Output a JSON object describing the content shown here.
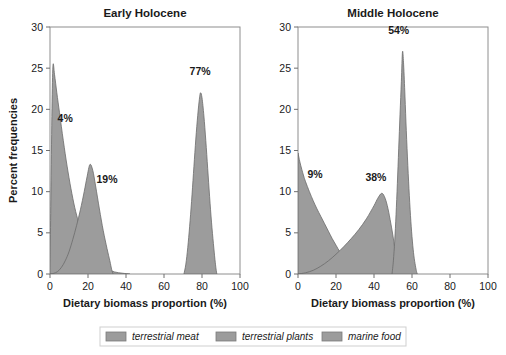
{
  "figure": {
    "background": "#ffffff",
    "series_color": "#9c9c9c",
    "series_edge_color": "#6b6b6b",
    "text_color": "#1a1a1a"
  },
  "axis": {
    "ylabel": "Percent frequencies",
    "xlabel_left": "Dietary biomass proportion (%)",
    "xlabel_right": "Dietary biomass proportion (%)",
    "yticks": [
      "0",
      "5",
      "10",
      "15",
      "20",
      "25",
      "30"
    ],
    "xticks": [
      "0",
      "20",
      "40",
      "60",
      "80",
      "100"
    ],
    "xlim": [
      0,
      100
    ],
    "ylim": [
      0,
      30
    ]
  },
  "legend": {
    "position": "bottom-center",
    "items": [
      {
        "label": "terrestrial meat",
        "color": "#9c9c9c"
      },
      {
        "label": "terrestrial plants",
        "color": "#9c9c9c"
      },
      {
        "label": "marine food",
        "color": "#9c9c9c"
      }
    ]
  },
  "chart_data": [
    {
      "type": "area",
      "title": "Early Holocene",
      "xlabel": "Dietary biomass proportion (%)",
      "ylabel": "Percent frequencies",
      "xlim": [
        0,
        100
      ],
      "ylim": [
        0,
        30
      ],
      "grid": false,
      "series": [
        {
          "name": "terrestrial meat",
          "annotation": "4%",
          "annotation_x": 8,
          "annotation_y": 18.5,
          "mode": 1,
          "peak_value": 25.4,
          "points": [
            [
              0,
              0.4
            ],
            [
              0.6,
              12
            ],
            [
              1.1,
              21
            ],
            [
              1.6,
              25.4
            ],
            [
              2.4,
              24.2
            ],
            [
              3.6,
              22.0
            ],
            [
              5,
              19.6
            ],
            [
              7,
              16.2
            ],
            [
              9,
              13.1
            ],
            [
              11,
              10.4
            ],
            [
              13,
              8.1
            ],
            [
              15,
              6.3
            ],
            [
              17,
              4.8
            ],
            [
              19,
              3.6
            ],
            [
              21,
              2.7
            ],
            [
              24,
              1.7
            ],
            [
              27,
              1.0
            ],
            [
              30,
              0.6
            ],
            [
              34,
              0.25
            ],
            [
              38,
              0.1
            ],
            [
              42,
              0.0
            ]
          ]
        },
        {
          "name": "terrestrial plants",
          "annotation": "19%",
          "annotation_x": 30,
          "annotation_y": 11.0,
          "mode": 21,
          "peak_value": 13.3,
          "points": [
            [
              0,
              0.0
            ],
            [
              2,
              0.08
            ],
            [
              4,
              0.3
            ],
            [
              6,
              0.8
            ],
            [
              8,
              1.6
            ],
            [
              10,
              2.7
            ],
            [
              12,
              4.2
            ],
            [
              14,
              5.9
            ],
            [
              16,
              7.8
            ],
            [
              18,
              10.0
            ],
            [
              19.5,
              11.8
            ],
            [
              21,
              13.3
            ],
            [
              22.5,
              12.6
            ],
            [
              24,
              10.7
            ],
            [
              26,
              7.9
            ],
            [
              28,
              5.3
            ],
            [
              30,
              3.1
            ],
            [
              31.5,
              1.6
            ],
            [
              32.5,
              0.5
            ],
            [
              33.2,
              0.0
            ]
          ]
        },
        {
          "name": "marine food",
          "annotation": "77%",
          "annotation_x": 79,
          "annotation_y": 24.2,
          "mode": 79,
          "peak_value": 22.0,
          "points": [
            [
              70.5,
              0.0
            ],
            [
              71.5,
              1.2
            ],
            [
              72.5,
              3.2
            ],
            [
              73.5,
              5.8
            ],
            [
              74.5,
              8.8
            ],
            [
              75.5,
              12.2
            ],
            [
              76.5,
              15.6
            ],
            [
              77.5,
              18.6
            ],
            [
              78.5,
              21.0
            ],
            [
              79.2,
              22.0
            ],
            [
              80,
              21.4
            ],
            [
              81,
              19.2
            ],
            [
              82,
              16.2
            ],
            [
              83,
              12.8
            ],
            [
              84,
              9.4
            ],
            [
              85,
              6.3
            ],
            [
              86,
              3.7
            ],
            [
              86.8,
              1.8
            ],
            [
              87.4,
              0.6
            ],
            [
              87.8,
              0.0
            ]
          ]
        }
      ]
    },
    {
      "type": "area",
      "title": "Middle Holocene",
      "xlabel": "Dietary biomass proportion (%)",
      "ylabel": "Percent frequencies",
      "xlim": [
        0,
        100
      ],
      "ylim": [
        0,
        30
      ],
      "grid": false,
      "series": [
        {
          "name": "terrestrial meat",
          "annotation": "9%",
          "annotation_x": 9,
          "annotation_y": 11.6,
          "mode": 0,
          "peak_value": 14.7,
          "points": [
            [
              0,
              14.7
            ],
            [
              1,
              13.6
            ],
            [
              2,
              12.7
            ],
            [
              3,
              11.9
            ],
            [
              4,
              11.2
            ],
            [
              6,
              10.0
            ],
            [
              8,
              8.9
            ],
            [
              10,
              7.9
            ],
            [
              12,
              7.0
            ],
            [
              14,
              6.1
            ],
            [
              16,
              5.2
            ],
            [
              18,
              4.3
            ],
            [
              20,
              3.5
            ],
            [
              22,
              2.7
            ],
            [
              24,
              2.0
            ],
            [
              27,
              1.2
            ],
            [
              30,
              0.7
            ],
            [
              34,
              0.35
            ],
            [
              38,
              0.15
            ],
            [
              42,
              0.05
            ],
            [
              46,
              0.0
            ]
          ]
        },
        {
          "name": "terrestrial plants",
          "annotation": "38%",
          "annotation_x": 41,
          "annotation_y": 11.3,
          "mode": 44,
          "peak_value": 9.8,
          "points": [
            [
              0,
              0.0
            ],
            [
              4,
              0.15
            ],
            [
              8,
              0.45
            ],
            [
              12,
              0.95
            ],
            [
              16,
              1.6
            ],
            [
              20,
              2.4
            ],
            [
              24,
              3.3
            ],
            [
              28,
              4.3
            ],
            [
              32,
              5.4
            ],
            [
              36,
              6.7
            ],
            [
              40,
              8.3
            ],
            [
              42,
              9.2
            ],
            [
              44,
              9.8
            ],
            [
              45.5,
              9.4
            ],
            [
              47,
              8.3
            ],
            [
              48.5,
              6.6
            ],
            [
              50,
              4.6
            ],
            [
              51,
              2.9
            ],
            [
              51.8,
              1.3
            ],
            [
              52.3,
              0.0
            ]
          ]
        },
        {
          "name": "marine food",
          "annotation": "54%",
          "annotation_x": 53,
          "annotation_y": 29.1,
          "mode": 55,
          "peak_value": 27.0,
          "points": [
            [
              49.5,
              0.0
            ],
            [
              50.2,
              1.6
            ],
            [
              50.9,
              4.0
            ],
            [
              51.6,
              7.2
            ],
            [
              52.3,
              11.0
            ],
            [
              53.0,
              15.2
            ],
            [
              53.7,
              19.4
            ],
            [
              54.4,
              23.4
            ],
            [
              55.0,
              27.0
            ],
            [
              55.6,
              25.4
            ],
            [
              56.3,
              21.6
            ],
            [
              57.0,
              17.4
            ],
            [
              57.8,
              13.2
            ],
            [
              58.6,
              9.5
            ],
            [
              59.4,
              6.4
            ],
            [
              60.2,
              4.0
            ],
            [
              61.0,
              2.2
            ],
            [
              61.8,
              1.0
            ],
            [
              62.4,
              0.3
            ],
            [
              62.8,
              0.0
            ]
          ]
        }
      ]
    }
  ]
}
